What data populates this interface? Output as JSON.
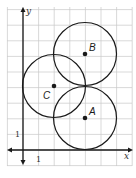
{
  "figure": {
    "axes": {
      "x_label": "x",
      "y_label": "y",
      "x_tick_label": "1",
      "y_tick_label": "1",
      "x_range": [
        -1,
        7
      ],
      "y_range": [
        -1,
        9
      ]
    },
    "grid": {
      "unit_px": 15.6,
      "origin_px": [
        23,
        150
      ],
      "color": "#c8c8c8"
    },
    "circles": [
      {
        "label": "A",
        "center": [
          4,
          2
        ],
        "radius": 2
      },
      {
        "label": "B",
        "center": [
          4,
          6
        ],
        "radius": 2
      },
      {
        "label": "C",
        "center": [
          2,
          4
        ],
        "radius": 2
      }
    ],
    "colors": {
      "stroke": "#1a1a1a",
      "grid": "#c8c8c8"
    }
  }
}
